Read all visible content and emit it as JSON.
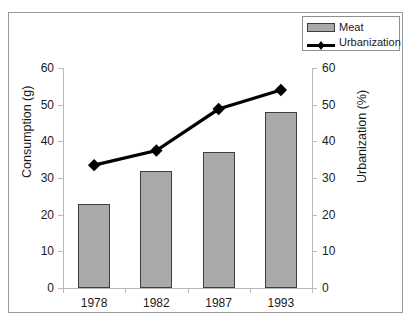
{
  "chart_data": {
    "type": "bar",
    "title": "",
    "categories": [
      "1978",
      "1982",
      "1987",
      "1993"
    ],
    "series": [
      {
        "name": "Meat",
        "type": "bar",
        "axis": "left",
        "values": [
          23,
          32,
          37,
          48
        ],
        "color": "#a9a9a9",
        "border_color": "#3d3d3d"
      },
      {
        "name": "Urbanization",
        "type": "line",
        "axis": "right",
        "values": [
          33.5,
          37.5,
          48.8,
          54
        ],
        "color": "#000000",
        "marker": "diamond"
      }
    ],
    "xlabel": "",
    "ylabel": "Consumption (g)",
    "y2label": "Urbanization (%)",
    "ylim": [
      0,
      60
    ],
    "y2lim": [
      0,
      60
    ],
    "yticks": [
      "0",
      "10",
      "20",
      "30",
      "40",
      "50",
      "60"
    ],
    "y2ticks": [
      "0",
      "10",
      "20",
      "30",
      "40",
      "50",
      "60"
    ],
    "grid": false,
    "legend_position": "top-right"
  },
  "legend": {
    "items": [
      {
        "label": "Meat",
        "marker": "bar-swatch"
      },
      {
        "label": "Urbanization",
        "marker": "line-diamond-swatch"
      }
    ]
  },
  "axes": {
    "left_title": "Consumption (g)",
    "right_title": "Urbanization (%)"
  }
}
